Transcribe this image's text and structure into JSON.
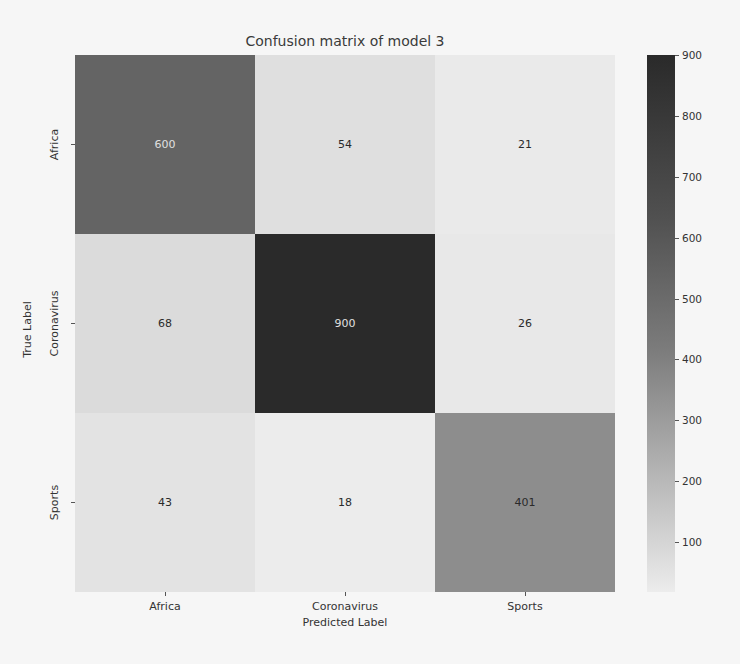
{
  "chart_data": {
    "type": "heatmap",
    "title": "Confusion matrix of model 3",
    "xlabel": "Predicted Label",
    "ylabel": "True Label",
    "x_categories": [
      "Africa",
      "Coronavirus",
      "Sports"
    ],
    "y_categories": [
      "Africa",
      "Coronavirus",
      "Sports"
    ],
    "values": [
      [
        600,
        54,
        21
      ],
      [
        68,
        900,
        26
      ],
      [
        43,
        18,
        401
      ]
    ],
    "colorbar": {
      "ticks": [
        100,
        200,
        300,
        400,
        500,
        600,
        700,
        800,
        900
      ],
      "range": [
        18,
        900
      ],
      "colormap": "grayscale (light = low, dark = high)"
    },
    "grid": false,
    "legend": "colorbar right"
  },
  "colors": {
    "high": "#2a2a2a",
    "low": "#ececec"
  }
}
